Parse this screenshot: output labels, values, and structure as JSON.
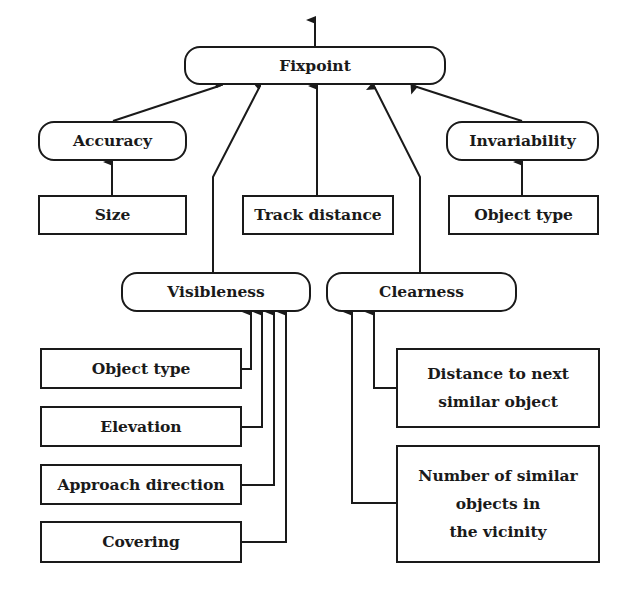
{
  "diagram": {
    "root": {
      "label": "Fixpoint"
    },
    "criteria": {
      "accuracy": {
        "label": "Accuracy",
        "children": [
          {
            "label": "Size"
          }
        ]
      },
      "track_distance": {
        "label": "Track distance"
      },
      "invariability": {
        "label": "Invariability",
        "children": [
          {
            "label": "Object type"
          }
        ]
      },
      "visibleness": {
        "label": "Visibleness",
        "children": [
          {
            "label": "Object type"
          },
          {
            "label": "Elevation"
          },
          {
            "label": "Approach direction"
          },
          {
            "label": "Covering"
          }
        ]
      },
      "clearness": {
        "label": "Clearness",
        "children": [
          {
            "label": "Distance to next\nsimilar object"
          },
          {
            "label": "Number of similar\nobjects in\nthe vicinity"
          }
        ]
      }
    },
    "colors": {
      "stroke": "#1a1a1a",
      "background": "#ffffff"
    }
  }
}
